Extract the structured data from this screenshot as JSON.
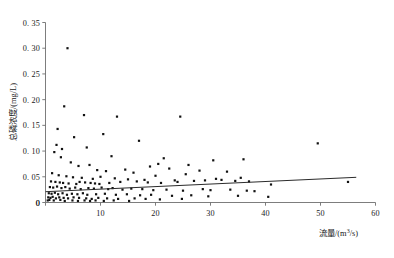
{
  "chart_data": {
    "type": "scatter",
    "title": "",
    "subtitle": "",
    "xlabel": "流量/(m³/s)",
    "ylabel": "总磷浓度/(mg/L)",
    "xlim": [
      0,
      60
    ],
    "ylim": [
      0,
      0.35
    ],
    "xticks": [
      0,
      10,
      20,
      30,
      40,
      50,
      60
    ],
    "xtick_labels": [
      "0",
      "10",
      "20",
      "30",
      "40",
      "50",
      "60"
    ],
    "yticks": [
      0,
      0.05,
      0.1,
      0.15,
      0.2,
      0.25,
      0.3,
      0.35
    ],
    "ytick_labels": [
      "0",
      "0. 05",
      "0. 10",
      "0. 15",
      "0. 20",
      "0. 25",
      "0. 30",
      "0. 35"
    ],
    "grid": false,
    "legend": false,
    "marker": "square",
    "marker_color": "#111111",
    "series": [
      {
        "name": "观测点",
        "x": [
          4.0,
          3.4,
          7.0,
          13.0,
          2.2,
          10.5,
          24.5,
          5.2,
          17.0,
          2.0,
          3.0,
          49.5,
          7.5,
          12.0,
          21.5,
          30.5,
          36.0,
          20.5,
          26.0,
          1.6,
          2.8,
          4.6,
          6.0,
          8.0,
          9.4,
          11.0,
          14.5,
          16.0,
          19.0,
          22.5,
          25.5,
          28.0,
          33.0,
          1.2,
          2.4,
          3.8,
          5.0,
          6.6,
          8.6,
          10.0,
          12.6,
          15.0,
          18.0,
          20.0,
          23.5,
          27.0,
          31.0,
          35.5,
          1.0,
          1.8,
          2.6,
          3.2,
          4.2,
          5.6,
          6.2,
          7.2,
          8.2,
          9.0,
          9.8,
          11.6,
          13.6,
          16.6,
          18.6,
          21.0,
          24.0,
          29.0,
          32.0,
          34.5,
          37.0,
          41.0,
          55.0,
          0.8,
          1.4,
          2.1,
          2.9,
          3.6,
          4.4,
          5.4,
          6.4,
          7.8,
          8.8,
          10.2,
          11.4,
          12.2,
          14.0,
          15.6,
          17.6,
          19.6,
          22.0,
          25.0,
          28.6,
          30.0,
          33.6,
          36.6,
          38.0,
          0.6,
          1.1,
          1.7,
          2.3,
          3.1,
          3.9,
          4.8,
          5.8,
          6.8,
          7.6,
          9.2,
          10.8,
          12.8,
          14.8,
          17.2,
          19.2,
          23.0,
          26.5,
          29.6,
          35.0,
          40.5,
          0.5,
          0.9,
          1.3,
          1.9,
          2.5,
          3.3,
          4.1,
          5.1,
          6.1,
          7.4,
          8.4,
          9.6,
          11.2,
          13.2,
          16.2,
          18.2,
          20.8,
          24.8,
          0.4,
          0.7,
          1.5,
          2.7,
          3.5,
          4.9,
          5.9,
          7.1,
          8.1,
          9.1,
          10.6,
          12.4,
          15.2
        ],
        "y": [
          0.3,
          0.187,
          0.17,
          0.167,
          0.143,
          0.133,
          0.167,
          0.127,
          0.12,
          0.112,
          0.104,
          0.115,
          0.107,
          0.09,
          0.086,
          0.082,
          0.084,
          0.075,
          0.073,
          0.098,
          0.088,
          0.078,
          0.071,
          0.073,
          0.063,
          0.061,
          0.064,
          0.058,
          0.07,
          0.066,
          0.055,
          0.062,
          0.06,
          0.057,
          0.053,
          0.051,
          0.049,
          0.048,
          0.046,
          0.05,
          0.047,
          0.045,
          0.044,
          0.052,
          0.043,
          0.042,
          0.046,
          0.048,
          0.041,
          0.04,
          0.039,
          0.038,
          0.037,
          0.036,
          0.04,
          0.039,
          0.038,
          0.037,
          0.036,
          0.038,
          0.04,
          0.041,
          0.039,
          0.038,
          0.04,
          0.043,
          0.044,
          0.042,
          0.041,
          0.035,
          0.04,
          0.03,
          0.029,
          0.031,
          0.028,
          0.03,
          0.027,
          0.029,
          0.026,
          0.028,
          0.027,
          0.029,
          0.026,
          0.028,
          0.025,
          0.027,
          0.026,
          0.024,
          0.025,
          0.023,
          0.026,
          0.024,
          0.025,
          0.023,
          0.022,
          0.018,
          0.017,
          0.019,
          0.016,
          0.018,
          0.015,
          0.017,
          0.016,
          0.018,
          0.015,
          0.016,
          0.017,
          0.015,
          0.016,
          0.014,
          0.015,
          0.013,
          0.014,
          0.012,
          0.013,
          0.011,
          0.01,
          0.009,
          0.011,
          0.008,
          0.01,
          0.009,
          0.008,
          0.01,
          0.009,
          0.008,
          0.007,
          0.009,
          0.008,
          0.007,
          0.008,
          0.007,
          0.006,
          0.007,
          0.004,
          0.005,
          0.004,
          0.005,
          0.003,
          0.004,
          0.003,
          0.004,
          0.003,
          0.004,
          0.003,
          0.004,
          0.003
        ]
      }
    ],
    "trendline": {
      "name": "线性趋势线",
      "x_start": 0.0,
      "y_start": 0.021,
      "x_end": 56.5,
      "y_end": 0.049,
      "color": "#2b2b2b"
    }
  }
}
